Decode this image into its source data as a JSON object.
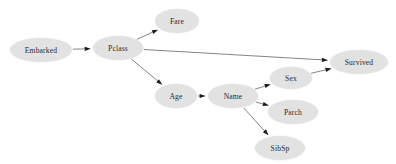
{
  "figure": {
    "title": "",
    "background_color": "#ffffff",
    "node_fill_color": "#e2e2e2",
    "node_text_color": "#2b2b2b",
    "edge_color": "#6f6f6f",
    "arrowhead_color": "#1a1a1a",
    "width": 396,
    "height": 164
  },
  "chart_data": {
    "type": "diagram",
    "diagram_type": "directed-acyclic-graph",
    "title": "",
    "xlabel": "",
    "ylabel": "",
    "grid": false,
    "legend": null,
    "nodes": [
      {
        "id": "embarked",
        "label": "Embarked",
        "cx": 41,
        "cy": 50,
        "rx": 31,
        "ry": 12
      },
      {
        "id": "pclass",
        "label": "Pclass",
        "cx": 118,
        "cy": 48,
        "rx": 25,
        "ry": 12
      },
      {
        "id": "fare",
        "label": "Fare",
        "cx": 177,
        "cy": 21,
        "rx": 22,
        "ry": 12
      },
      {
        "id": "age",
        "label": "Age",
        "cx": 176,
        "cy": 96,
        "rx": 21,
        "ry": 12
      },
      {
        "id": "name",
        "label": "Name",
        "cx": 233,
        "cy": 96,
        "rx": 25,
        "ry": 12
      },
      {
        "id": "sex",
        "label": "Sex",
        "cx": 291,
        "cy": 78,
        "rx": 21,
        "ry": 11
      },
      {
        "id": "parch",
        "label": "Parch",
        "cx": 293,
        "cy": 112,
        "rx": 25,
        "ry": 12
      },
      {
        "id": "sibsp",
        "label": "SibSp",
        "cx": 280,
        "cy": 148,
        "rx": 25,
        "ry": 12
      },
      {
        "id": "survived",
        "label": "Survived",
        "cx": 359,
        "cy": 62,
        "rx": 29,
        "ry": 12
      }
    ],
    "edges": [
      {
        "from": "embarked",
        "to": "pclass",
        "label": ""
      },
      {
        "from": "pclass",
        "to": "fare",
        "label": ""
      },
      {
        "from": "pclass",
        "to": "survived",
        "label": ""
      },
      {
        "from": "pclass",
        "to": "age",
        "label": ""
      },
      {
        "from": "age",
        "to": "name",
        "label": ""
      },
      {
        "from": "name",
        "to": "sex",
        "label": ""
      },
      {
        "from": "name",
        "to": "parch",
        "label": ""
      },
      {
        "from": "name",
        "to": "sibsp",
        "label": ""
      },
      {
        "from": "sex",
        "to": "survived",
        "label": ""
      }
    ]
  }
}
